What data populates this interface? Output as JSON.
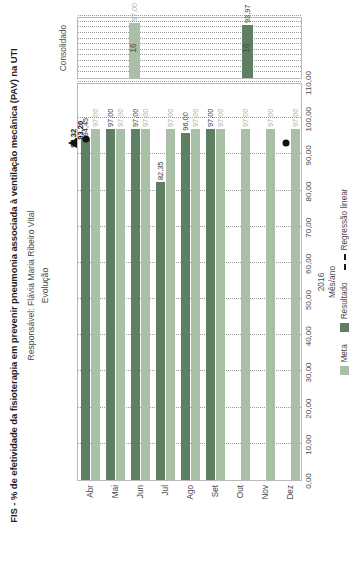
{
  "header": {
    "title": "FIS - % de efetividade da fisioterapia em prevenir pneumonia associada à ventilação mecânica (PAV) na UTI",
    "responsible": "Responsável: Flávia Maria Ribeiro Vital",
    "section_label": "Evolução",
    "consolidated_label": "Consolidado"
  },
  "legend": {
    "meta": "Meta",
    "resultado": "Resultado",
    "regressao": "Regressão linear"
  },
  "axis": {
    "x_title_year": "2016",
    "x_title_unit": "Mês/ano"
  },
  "colors": {
    "meta": "#a9bfa6",
    "resultado": "#5f7f63",
    "regressao": "#1a1a1a",
    "frame": "#b9b9b9",
    "grid": "#9a9a9a"
  },
  "chart_data": {
    "type": "bar",
    "title": "FIS - % de efetividade da fisioterapia em prevenir pneumonia associada à ventilação mecânica (PAV) na UTI",
    "xlabel": "Mês/ano",
    "ylabel": "",
    "ylim": [
      0,
      110
    ],
    "yticks": [
      "0,00",
      "10,00",
      "20,00",
      "30,00",
      "40,00",
      "50,00",
      "60,00",
      "70,00",
      "80,00",
      "90,00",
      "100,00",
      "110,00"
    ],
    "ytick_values": [
      0,
      10,
      20,
      30,
      40,
      50,
      60,
      70,
      80,
      90,
      100,
      110
    ],
    "grid": true,
    "legend_position": "bottom",
    "categories": [
      "Abr",
      "Mai",
      "Jun",
      "Jul",
      "Ago",
      "Set",
      "Out",
      "Nov",
      "Dez"
    ],
    "series": [
      {
        "name": "Meta",
        "values": [
          97.0,
          97.0,
          97.0,
          97.0,
          97.0,
          97.0,
          97.0,
          97.0,
          97.0
        ],
        "labels": [
          "97,00",
          "97,00",
          "97,00",
          "97,00",
          "97,00",
          "97,00",
          "97,00",
          "97,00",
          "97,00"
        ]
      },
      {
        "name": "Resultado",
        "values": [
          94.45,
          97.0,
          97.0,
          82.35,
          96.0,
          97.0,
          null,
          null,
          null
        ],
        "labels": [
          "94,45",
          "97,00",
          "97,00",
          "82,35",
          "96,00",
          "97,00",
          "",
          "",
          ""
        ]
      },
      {
        "name": "Regressão linear",
        "start_value": 94.32,
        "start_label": "94,32",
        "end_value": 93.2,
        "end_label": "93,20"
      }
    ],
    "consolidated": {
      "categories": [
        "16",
        "16"
      ],
      "series": [
        {
          "name": "Meta",
          "values": [
            97.0
          ],
          "labels": [
            "97,00"
          ]
        },
        {
          "name": "Resultado",
          "values": [
            93.97
          ],
          "labels": [
            "93,97"
          ]
        }
      ]
    }
  }
}
